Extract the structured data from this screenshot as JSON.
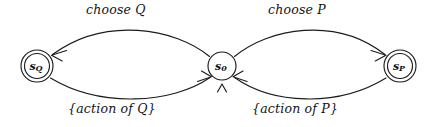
{
  "diagram": {
    "type": "state-transition-diagram",
    "background_color": "#ffffff",
    "stroke_color": "#1c1c1c",
    "nodes": [
      {
        "id": "sQ",
        "label_base": "s",
        "label_sub": "Q",
        "shape": "double-circle",
        "accepting": true,
        "cx": 37,
        "cy": 66,
        "r_outer": 16,
        "r_inner": 12.5
      },
      {
        "id": "s0",
        "label_base": "s",
        "label_sub": "0",
        "shape": "circle",
        "accepting": false,
        "cx": 222,
        "cy": 66,
        "r_outer": 14,
        "r_inner": 14
      },
      {
        "id": "sP",
        "label_base": "s",
        "label_sub": "P",
        "shape": "double-circle",
        "accepting": true,
        "cx": 400,
        "cy": 66,
        "r_outer": 16,
        "r_inner": 12.5
      }
    ],
    "edges": [
      {
        "id": "choose-q",
        "label": "choose Q",
        "from": "s0",
        "to": "sQ",
        "direction": "leftward",
        "position": "top-left"
      },
      {
        "id": "choose-p",
        "label": "choose P",
        "from": "s0",
        "to": "sP",
        "direction": "rightward",
        "position": "top-right"
      },
      {
        "id": "action-of-q",
        "label": "{action of Q}",
        "from": "sQ",
        "to": "s0",
        "direction": "rightward",
        "position": "bottom-left"
      },
      {
        "id": "action-of-p",
        "label": "{action of P}",
        "from": "sP",
        "to": "s0",
        "direction": "leftward",
        "position": "bottom-right"
      }
    ],
    "marks": [
      {
        "id": "wedge-below-s0",
        "glyph": "∧",
        "x": 222,
        "y": 88
      }
    ]
  }
}
